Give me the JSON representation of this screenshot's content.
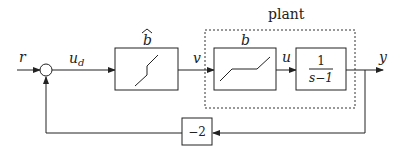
{
  "diagram": {
    "type": "block-diagram",
    "signals": {
      "input": "r",
      "after_sum": "u",
      "after_sum_sub": "d",
      "after_bhat": "v",
      "after_b": "u",
      "output": "y"
    },
    "blocks": {
      "bhat": {
        "label": "b",
        "accent": "^",
        "shape": "saturation-deadzone-inverse"
      },
      "plant_group": {
        "label": "plant"
      },
      "b": {
        "label": "b",
        "shape": "deadzone"
      },
      "transfer": {
        "numerator": "1",
        "denominator": "s−1"
      },
      "feedback_gain": {
        "label": "−2"
      }
    },
    "summing_junction": {
      "inputs": [
        "r",
        "feedback"
      ]
    }
  }
}
